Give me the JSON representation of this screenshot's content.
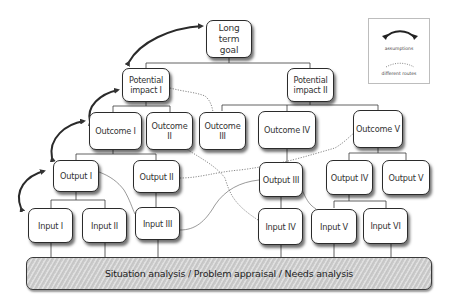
{
  "diagram": {
    "nodes": {
      "goal": "Long term goal",
      "impact1": "Potential impact I",
      "impact2": "Potential impact II",
      "outcome1": "Outcome I",
      "outcome2": "Outcome II",
      "outcome3": "Outcome III",
      "outcome4": "Outcome IV",
      "outcome5": "Outcome V",
      "output1": "Output I",
      "output2": "Output II",
      "output3": "Output III",
      "output4": "Output IV",
      "output5": "Output V",
      "input1": "Input I",
      "input2": "Input II",
      "input3": "Input III",
      "input4": "Input IV",
      "input5": "Input V",
      "input6": "Input VI"
    },
    "base_bar": "Situation analysis / Problem appraisal / Needs analysis",
    "legend": {
      "assumptions": "assumptions",
      "different_routes": "different routes"
    },
    "edges_solid": [
      [
        "goal",
        "impact1"
      ],
      [
        "goal",
        "impact2"
      ],
      [
        "impact1",
        "outcome1"
      ],
      [
        "impact1",
        "outcome2"
      ],
      [
        "impact2",
        "outcome3"
      ],
      [
        "impact2",
        "outcome4"
      ],
      [
        "impact2",
        "outcome5"
      ],
      [
        "outcome1",
        "output1"
      ],
      [
        "outcome1",
        "output2"
      ],
      [
        "outcome4",
        "output3"
      ],
      [
        "outcome5",
        "output4"
      ],
      [
        "outcome5",
        "output5"
      ],
      [
        "output1",
        "input1"
      ],
      [
        "output1",
        "input2"
      ],
      [
        "output2",
        "input3"
      ],
      [
        "output3",
        "input4"
      ],
      [
        "output4",
        "input5"
      ],
      [
        "output4",
        "input6"
      ]
    ],
    "edges_dotted_routes": [
      [
        "impact1",
        "outcome3"
      ],
      [
        "outcome2",
        "input4"
      ],
      [
        "output2",
        "outcome5"
      ],
      [
        "input3",
        "output3"
      ],
      [
        "output1",
        "input3"
      ],
      [
        "output3",
        "input5"
      ]
    ],
    "assumption_arrows": [
      [
        "goal",
        "impact1"
      ],
      [
        "impact1",
        "outcome1"
      ],
      [
        "outcome1",
        "output1"
      ],
      [
        "output1",
        "input1"
      ]
    ],
    "colors": {
      "line": "#2b2b2b",
      "box_fill": "#ffffff",
      "bar_fill": "#cfcfcf",
      "text": "#333333"
    }
  }
}
